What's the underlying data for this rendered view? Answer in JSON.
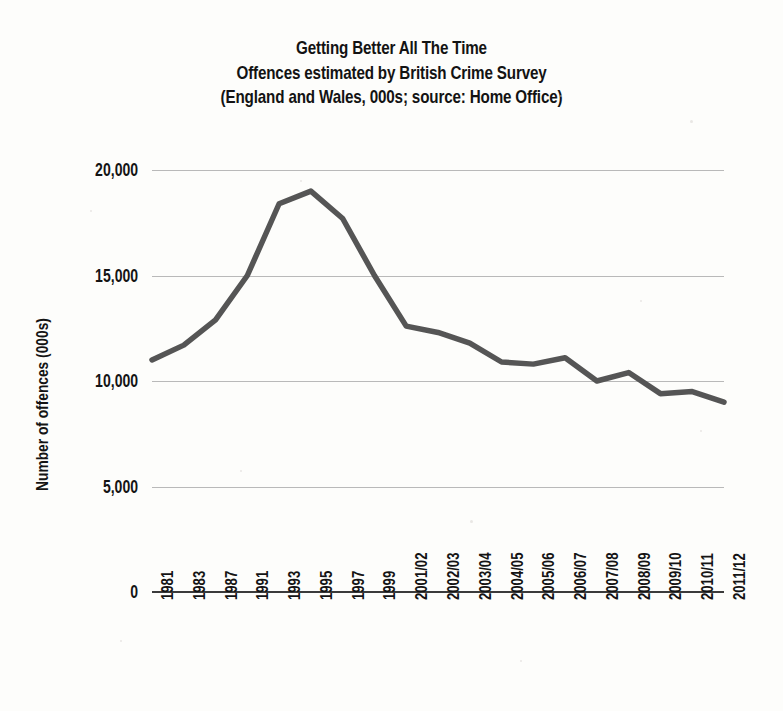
{
  "chart_data": {
    "type": "line",
    "title": "Getting Better All The Time",
    "subtitle": "Offences estimated by British Crime Survey",
    "source_line": "(England and Wales, 000s; source: Home Office)",
    "xlabel": "",
    "ylabel": "Number of offences (000s)",
    "ylim": [
      0,
      20000
    ],
    "ytick_values": [
      0,
      5000,
      10000,
      15000,
      20000
    ],
    "ytick_labels": [
      "0",
      "5,000",
      "10,000",
      "15,000",
      "20,000"
    ],
    "grid": true,
    "legend": "none",
    "line_color": "#555555",
    "categories": [
      "1981",
      "1983",
      "1987",
      "1991",
      "1993",
      "1995",
      "1997",
      "1999",
      "2001/02",
      "2002/03",
      "2003/04",
      "2004/05",
      "2005/06",
      "2006/07",
      "2007/08",
      "2008/09",
      "2009/10",
      "2010/11",
      "2011/12"
    ],
    "values": [
      11000,
      11700,
      12900,
      15000,
      18400,
      19000,
      17700,
      15000,
      12600,
      12300,
      11800,
      10900,
      10800,
      11100,
      10000,
      10400,
      9400,
      9500,
      9000
    ],
    "series": [
      {
        "name": "Offences estimated by British Crime Survey",
        "values": [
          11000,
          11700,
          12900,
          15000,
          18400,
          19000,
          17700,
          15000,
          12600,
          12300,
          11800,
          10900,
          10800,
          11100,
          10000,
          10400,
          9400,
          9500,
          9000
        ]
      }
    ]
  }
}
